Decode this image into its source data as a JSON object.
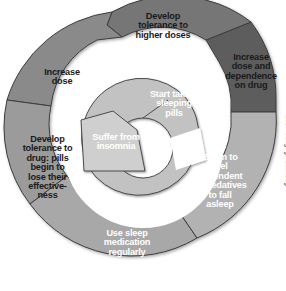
{
  "figure": {
    "type": "cyclical-spiral-diagram",
    "colors": {
      "background": "#ffffff",
      "outer_dark_gray": "#6e6e6e",
      "outer_darkest_gray": "#5b5b5b",
      "mid_gray": "#8c8c8c",
      "light_gray": "#a8a8a8",
      "inner_light_gray": "#c2c2c2",
      "innermost_gray": "#cfcfcf",
      "label_dark_text": "#1a1a1a",
      "label_light_text": "#ffffff",
      "edge_line": "#3b3b3b"
    }
  },
  "segments": [
    {
      "id": "suffer-insomnia",
      "order": 1,
      "label": "Suffer from\ninsomnia",
      "text_color": "dark",
      "fill": "#cfcfcf",
      "ring": "inner"
    },
    {
      "id": "start-taking-pills",
      "order": 2,
      "label": "Start taking\nsleeping\npills",
      "text_color": "dark",
      "fill": "#c2c2c2",
      "ring": "inner"
    },
    {
      "id": "begin-to-feel-dependent",
      "order": 3,
      "label": "Begin to\nfeel\ndependent\non sedatives\nto fall\nasleep",
      "text_color": "dark",
      "fill": "#b2b2b2",
      "ring": "outer"
    },
    {
      "id": "use-sleep-medication",
      "order": 4,
      "label": "Use sleep\nmedication\nregularly",
      "text_color": "dark",
      "fill": "#a8a8a8",
      "ring": "outer"
    },
    {
      "id": "develop-tolerance-drug",
      "order": 5,
      "label": "Develop\ntolerance to\ndrug: pills\nbegin to\nlose their\neffective-\nness",
      "text_color": "light",
      "fill": "#9b9b9b",
      "ring": "outer"
    },
    {
      "id": "increase-dose",
      "order": 6,
      "label": "Increase\ndose",
      "text_color": "light",
      "fill": "#8a8a8a",
      "ring": "outer"
    },
    {
      "id": "develop-tolerance-higher-doses",
      "order": 7,
      "label": "Develop\ntolerance to\nhigher doses",
      "text_color": "light",
      "fill": "#767676",
      "ring": "outer"
    },
    {
      "id": "increase-dose-dependence",
      "order": 8,
      "label": "Increase\ndose and\ndependence\non drug",
      "text_color": "light",
      "fill": "#5d5d5d",
      "ring": "outer"
    }
  ],
  "credit": {
    "text": "© 2017 Cengage Learning"
  }
}
